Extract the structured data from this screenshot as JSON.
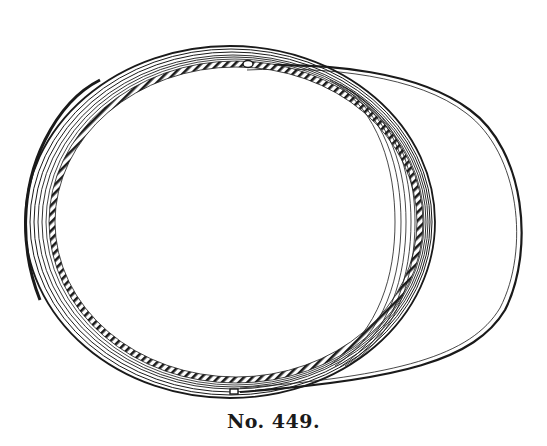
{
  "illustration": {
    "subject": "cap viewed from above with brim (visor)",
    "style": "black line engraving on white",
    "ink_color": "#1a1a1a",
    "background_color": "#ffffff"
  },
  "caption": {
    "text": "No. 449."
  }
}
